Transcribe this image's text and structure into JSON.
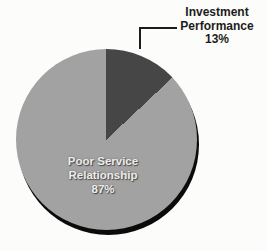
{
  "chart_data": {
    "type": "pie",
    "title": "",
    "start_angle_deg": 0,
    "direction": "clockwise",
    "slices": [
      {
        "label": "Investment Performance",
        "value": 13,
        "pct_label": "13%",
        "color": "#464646",
        "label_style": "external-callout"
      },
      {
        "label": "Poor Service Relationship",
        "value": 87,
        "pct_label": "87%",
        "color": "#a2a2a2",
        "label_style": "internal"
      }
    ],
    "legend_position": "none",
    "background_color": "#fcfcfa",
    "shadow": true
  }
}
